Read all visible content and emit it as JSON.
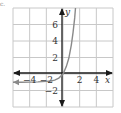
{
  "partial_label": "c.",
  "chart_data": {
    "type": "line",
    "title": "",
    "xlabel": "x",
    "ylabel": "y",
    "xlim": [
      -6,
      6
    ],
    "ylim": [
      -4,
      8
    ],
    "grid": true,
    "grid_step": 2,
    "x_ticks": [
      {
        "value": -4,
        "label": "−4"
      },
      {
        "value": -2,
        "label": "−2"
      },
      {
        "value": 2,
        "label": "2"
      },
      {
        "value": 4,
        "label": "4"
      }
    ],
    "y_ticks": [
      {
        "value": 6,
        "label": "6"
      },
      {
        "value": 4,
        "label": "4"
      },
      {
        "value": 2,
        "label": "2"
      },
      {
        "value": -2,
        "label": "−2"
      }
    ],
    "series": [
      {
        "name": "curve",
        "description": "exponential growth through origin with horizontal asymptote y = -1",
        "color": "#8a8a8a",
        "x": [
          -6,
          -5,
          -4,
          -3,
          -2,
          -1.5,
          -1,
          -0.5,
          0,
          0.4,
          0.7,
          1.0,
          1.2,
          1.4,
          1.5
        ],
        "y": [
          -1.0,
          -0.99,
          -0.98,
          -0.96,
          -0.9,
          -0.85,
          -0.75,
          -0.5,
          0,
          0.9,
          1.9,
          3.5,
          5.0,
          6.8,
          8.0
        ]
      }
    ],
    "colors": {
      "grid": "#c8c8c8",
      "axes": "#1a1a1a",
      "curve": "#8a8a8a"
    }
  }
}
